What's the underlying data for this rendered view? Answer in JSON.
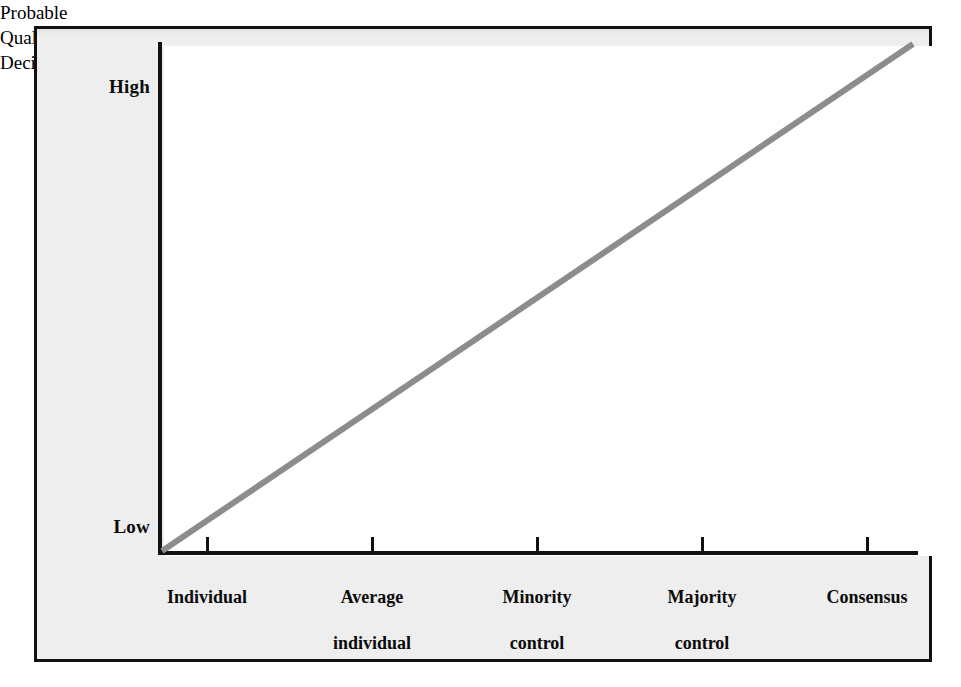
{
  "chart_data": {
    "type": "line",
    "title": "",
    "xlabel": "Method of Utilization of Group Resources",
    "ylabel": "Probable Quality of Decision",
    "categories": [
      "Individual",
      "Average individual",
      "Minority control",
      "Majority control",
      "Consensus"
    ],
    "x": [
      1,
      2,
      3,
      4,
      5
    ],
    "values": [
      0,
      25,
      50,
      75,
      100
    ],
    "ylim": [
      0,
      100
    ],
    "ytick_labels": [
      "Low",
      "High"
    ],
    "xtick_labels": [
      "Individual",
      "Average\nindividual",
      "Minority\ncontrol",
      "Majority\ncontrol",
      "Consensus"
    ],
    "grid": false,
    "legend": false,
    "series": [
      {
        "name": "Probable quality of decision",
        "values": [
          0,
          25,
          50,
          75,
          100
        ],
        "color": "#8c8c8c"
      }
    ],
    "annotations": []
  },
  "axes": {
    "y_high_label": "High",
    "y_low_label": "Low",
    "y_title_lines": [
      "Probable",
      "Quality of",
      "Decision"
    ],
    "x_title": "Method of Utilization of Group Resources",
    "x_tick_labels": [
      {
        "line1": "Individual",
        "line2": ""
      },
      {
        "line1": "Average",
        "line2": "individual"
      },
      {
        "line1": "Minority",
        "line2": "control"
      },
      {
        "line1": "Majority",
        "line2": "control"
      },
      {
        "line1": "Consensus",
        "line2": ""
      }
    ]
  },
  "colors": {
    "line": "#8c8c8c",
    "axis": "#111111",
    "frame": "#111111",
    "margin_background": "#eeeeee",
    "plot_background": "#ffffff",
    "text": "#0b0b0b"
  }
}
